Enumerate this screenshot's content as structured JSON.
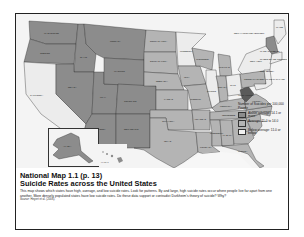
{
  "caption": {
    "title_line1": "National Map 1.1  (p. 13)",
    "title_line2": "Suicide Rates across the United States",
    "body": "This map shows which states have high, average, and low suicide rates. Look for patterns. By and large, high suicide rates occur where people live far apart from one another. More densely populated states have low suicide rates. Do these data support or contradict Durkheim's theory of suicide? Why?",
    "source_label": "Source:",
    "source_text": "Heyert et al. (2006)."
  },
  "legend": {
    "title": "Number of Suicides per 100,000 People",
    "items": [
      {
        "label": "Above average: 14.1 or more",
        "color": "#8c8c8c"
      },
      {
        "label": "Average: 11.0 to 14.0",
        "color": "#b4b4b4"
      },
      {
        "label": "Below average: 11.0 or below",
        "color": "#f0f0f0"
      }
    ]
  },
  "colors": {
    "above": "#8c8c8c",
    "average": "#b4b4b4",
    "below": "#ececec",
    "water": "#f7f7f7",
    "border": "#333333"
  },
  "states": {
    "washington": "WASHINGTON",
    "oregon": "OREGON",
    "california": "CALIFORNIA",
    "idaho": "IDAHO",
    "nevada": "NEVADA",
    "utah": "UTAH",
    "arizona": "ARIZONA",
    "montana": "MONTANA",
    "wyoming": "WYOMING",
    "colorado": "COLORADO",
    "new_mexico": "NEW MEXICO",
    "north_dakota": "NORTH DAKOTA",
    "south_dakota": "SOUTH DAKOTA",
    "nebraska": "NEBRASKA",
    "kansas": "KANSAS",
    "oklahoma": "OKLAHOMA",
    "texas": "TEXAS",
    "minnesota": "MINNESOTA",
    "iowa": "IOWA",
    "missouri": "MISSOURI",
    "arkansas": "ARKANSAS",
    "louisiana": "LOUISIANA",
    "wisconsin": "WISCONSIN",
    "illinois": "ILLINOIS",
    "michigan": "MICHIGAN",
    "indiana": "INDIANA",
    "ohio": "OHIO",
    "kentucky": "KENTUCKY",
    "tennessee": "TENNESSEE",
    "mississippi": "MISSISSIPPI",
    "alabama": "ALABAMA",
    "georgia": "GEORGIA",
    "florida": "FLORIDA",
    "south_carolina": "SOUTH CAROLINA",
    "north_carolina": "NORTH CAROLINA",
    "virginia": "VIRGINIA",
    "west_virginia": "WEST VIRGINIA",
    "pennsylvania": "PENNSYLVANIA",
    "new_york": "NEW YORK",
    "vermont_nh": "NEW HAMPSHIRE VERMONT",
    "maine": "MAINE",
    "massachusetts": "MASSACHUSETTS",
    "ri_ct": "RHODE ISLAND CONNECTICUT",
    "new_jersey": "NEW JERSEY",
    "de_md": "DELAWARE MARYLAND",
    "alaska": "ALASKA",
    "hawaii": "HAWAII"
  }
}
